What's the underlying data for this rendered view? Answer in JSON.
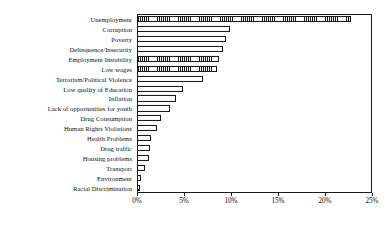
{
  "chart_data": {
    "type": "bar",
    "orientation": "horizontal",
    "title": "",
    "xlabel": "",
    "ylabel": "",
    "xlim": [
      0,
      25
    ],
    "xtick_labels": [
      "0%",
      "5%",
      "10%",
      "15%",
      "20%",
      "25%"
    ],
    "xticks": [
      0,
      5,
      10,
      15,
      20,
      25
    ],
    "grid": false,
    "legend": "none",
    "categories": [
      "Unemployment",
      "Corruption",
      "Poverty",
      "Delinquence/Insecurity",
      "Employment Instability",
      "Low wages",
      "Terrorism/Political Violence",
      "Low quality of Education",
      "Inflation",
      "Lack of opportunities for youth",
      "Drug Consumption",
      "Human Rights Violations",
      "Health Problems",
      "Drug traffic",
      "Housing problems",
      "Transport",
      "Environment",
      "Racial Discrimination"
    ],
    "values": [
      22.8,
      9.9,
      9.5,
      9.1,
      8.7,
      8.5,
      7.0,
      4.9,
      4.1,
      3.5,
      2.5,
      2.1,
      1.5,
      1.4,
      1.3,
      0.9,
      0.4,
      0.3
    ],
    "bar_fill": [
      "hatched",
      "plain",
      "plain",
      "plain",
      "hatched",
      "hatched",
      "plain",
      "plain",
      "plain",
      "plain",
      "plain",
      "plain",
      "plain",
      "plain",
      "plain",
      "plain",
      "plain",
      "plain"
    ],
    "colors": {
      "bar_edge": "#111111",
      "bar_face": "#ffffff",
      "axis": "#1a1a1a",
      "text": "#0d0d0d"
    }
  }
}
